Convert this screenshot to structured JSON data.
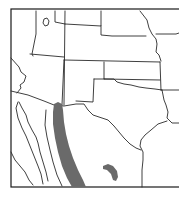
{
  "map": {
    "type": "species-range-map",
    "region": "Southwestern United States and northern Mexico",
    "colors": {
      "background": "#ffffff",
      "border_lines": "#2a2a2a",
      "range_fill": "#6a6a6a"
    },
    "features": {
      "state_borders": "visible",
      "country_border": "visible",
      "range_areas": [
        {
          "name": "main-range",
          "description": "Sierra Madre Occidental band, northwest Mexico, extending into SE Arizona / SW New Mexico border"
        },
        {
          "name": "disjunct-range",
          "description": "Small isolated area in northeastern Mexico"
        }
      ]
    }
  }
}
